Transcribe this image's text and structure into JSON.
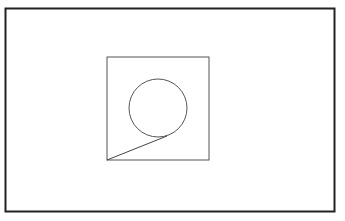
{
  "diagram": {
    "shapes": [
      {
        "kind": "frame",
        "name": "outer-frame",
        "stroke": "#222222"
      },
      {
        "kind": "square",
        "name": "inner-square",
        "stroke": "#555555"
      },
      {
        "kind": "circle",
        "name": "inner-circle",
        "stroke": "#555555"
      },
      {
        "kind": "segment",
        "name": "connecting-line",
        "from": "square bottom-left corner",
        "to": "circle lower-right point",
        "stroke": "#444444"
      }
    ]
  }
}
